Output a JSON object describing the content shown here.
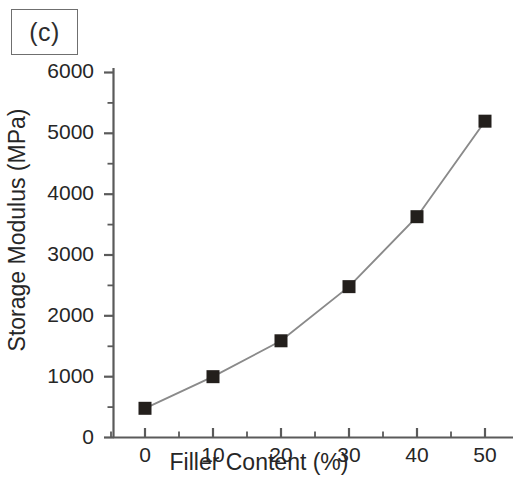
{
  "panel": {
    "label": "(c)"
  },
  "chart_data": {
    "type": "line",
    "title": "",
    "subtitle": "",
    "panel_label": "(c)",
    "xlabel": "Filler Content (%)",
    "ylabel": "Storage Modulus (MPa)",
    "x": [
      0,
      10,
      20,
      30,
      40,
      50
    ],
    "values": [
      480,
      1000,
      1590,
      2480,
      3630,
      5200
    ],
    "series": [
      {
        "name": "Storage Modulus",
        "x": [
          0,
          10,
          20,
          30,
          40,
          50
        ],
        "values": [
          480,
          1000,
          1590,
          2480,
          3630,
          5200
        ],
        "marker": "filled-square",
        "marker_color": "#231f1c",
        "line_color": "#8a8a8a"
      }
    ],
    "xlim": [
      -2.2,
      55
    ],
    "ylim": [
      0,
      6000
    ],
    "xticks": [
      0,
      10,
      20,
      30,
      40,
      50
    ],
    "xtick_labels": [
      "0",
      "10",
      "20",
      "30",
      "40",
      "50"
    ],
    "yticks": [
      0,
      1000,
      2000,
      3000,
      4000,
      5000,
      6000
    ],
    "ytick_labels": [
      "0",
      "1000",
      "2000",
      "3000",
      "4000",
      "5000",
      "6000"
    ],
    "x_minor_ticks": [
      5,
      15,
      25,
      35,
      45
    ],
    "y_minor_ticks": [
      500,
      1500,
      2500,
      3500,
      4500,
      5500
    ],
    "grid": false,
    "legend": false,
    "legend_position": "none",
    "spines": [
      "left",
      "bottom"
    ],
    "annotations": []
  },
  "axes": {
    "x_title": "Filler Content (%)",
    "y_title": "Storage Modulus (MPa)",
    "x_tick_labels": [
      "0",
      "10",
      "20",
      "30",
      "40",
      "50"
    ],
    "y_tick_labels": [
      "0",
      "1000",
      "2000",
      "3000",
      "4000",
      "5000",
      "6000"
    ]
  },
  "colors": {
    "marker": "#231f1c",
    "line": "#8a8a8a",
    "axis": "#5a5a5a",
    "text": "#262626",
    "background": "#ffffff"
  }
}
